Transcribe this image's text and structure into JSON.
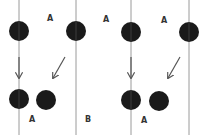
{
  "colors": {
    "background": "#ffffff",
    "line": "#9a9a9a",
    "circle": "#1a1a1a",
    "arrow": "#555555",
    "label": "#333333"
  },
  "diagram": {
    "vertical_lines": [
      {
        "x": 19
      },
      {
        "x": 76
      },
      {
        "x": 131
      },
      {
        "x": 189
      }
    ],
    "top_circles": [
      {
        "cx": 19,
        "cy": 31,
        "r": 10
      },
      {
        "cx": 76,
        "cy": 31,
        "r": 10
      },
      {
        "cx": 131,
        "cy": 32,
        "r": 10
      },
      {
        "cx": 189,
        "cy": 32,
        "r": 10
      }
    ],
    "bottom_circles": [
      {
        "cx": 19,
        "cy": 99,
        "r": 10
      },
      {
        "cx": 46,
        "cy": 100,
        "r": 10
      },
      {
        "cx": 131,
        "cy": 100,
        "r": 10
      },
      {
        "cx": 159,
        "cy": 101,
        "r": 10
      }
    ],
    "top_labels": [
      {
        "text": "A",
        "x": 47,
        "y": 21
      },
      {
        "text": "A",
        "x": 103,
        "y": 22
      },
      {
        "text": "A",
        "x": 161,
        "y": 23
      }
    ],
    "bottom_labels": [
      {
        "text": "A",
        "x": 29,
        "y": 122
      },
      {
        "text": "B",
        "x": 85,
        "y": 122
      },
      {
        "text": "A",
        "x": 141,
        "y": 123
      }
    ],
    "arrows": [
      {
        "x1": 19,
        "y1": 57,
        "x2": 19,
        "y2": 78
      },
      {
        "x1": 65,
        "y1": 57,
        "x2": 53,
        "y2": 78
      },
      {
        "x1": 131,
        "y1": 57,
        "x2": 131,
        "y2": 78
      },
      {
        "x1": 180,
        "y1": 57,
        "x2": 168,
        "y2": 78
      }
    ]
  }
}
